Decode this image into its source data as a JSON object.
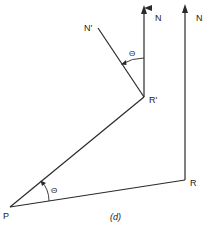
{
  "diagram": {
    "caption": "(d)",
    "colors": {
      "line": "#2a2a2a",
      "background": "#ffffff"
    },
    "points": {
      "P": {
        "label": "P",
        "x": 10,
        "y": 207
      },
      "R": {
        "label": "R",
        "x": 185,
        "y": 180
      },
      "R_prime": {
        "label": "R'",
        "x": 144,
        "y": 97
      },
      "N_prime": {
        "label": "N'",
        "x": 98,
        "y": 28
      }
    },
    "north_arrows": [
      {
        "label": "N",
        "from_point": "R'",
        "tip": {
          "x": 144,
          "y": 6
        }
      },
      {
        "label": "N",
        "from_point": "R",
        "tip": {
          "x": 185,
          "y": 5
        }
      }
    ],
    "angles": [
      {
        "label": "Θ",
        "at": "R'",
        "between": [
          "N",
          "N'"
        ]
      },
      {
        "label": "Θ",
        "at": "P",
        "between": [
          "PR",
          "PR'"
        ]
      }
    ],
    "segments": [
      "P-R",
      "P-R'",
      "R'-N'",
      "R'-N",
      "R-N"
    ]
  }
}
